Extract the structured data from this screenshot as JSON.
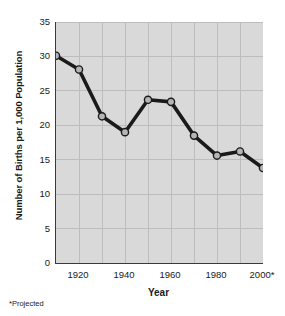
{
  "chart_data": {
    "type": "line",
    "title": "",
    "xlabel": "Year",
    "ylabel": "Number of Births per 1,000 Population",
    "x": [
      1910,
      1920,
      1930,
      1940,
      1950,
      1960,
      1970,
      1980,
      1990,
      2000
    ],
    "values": [
      30.1,
      28.1,
      21.3,
      19.0,
      23.7,
      23.4,
      18.5,
      15.6,
      16.2,
      13.8
    ],
    "series": [
      {
        "name": "Births per 1,000 population",
        "values": [
          30.1,
          28.1,
          21.3,
          19.0,
          23.7,
          23.4,
          18.5,
          15.6,
          16.2,
          13.8
        ]
      }
    ],
    "xlim": [
      1910,
      2000
    ],
    "ylim": [
      0,
      35
    ],
    "yticks": [
      0,
      5,
      10,
      15,
      20,
      25,
      30,
      35
    ],
    "ytick_labels": [
      "0",
      "5",
      "10",
      "15",
      "20",
      "25",
      "30",
      "35"
    ],
    "xticks": [
      1920,
      1940,
      1960,
      1980,
      2000
    ],
    "xtick_labels": [
      "1920",
      "1940",
      "1960",
      "1980",
      "2000*"
    ],
    "x_gridlines": [
      1920,
      1930,
      1940,
      1950,
      1960,
      1970,
      1980,
      1990,
      2000
    ],
    "grid": true,
    "legend": false,
    "footnote": "*Projected",
    "colors": {
      "plot_background": "#d9d9d9",
      "gridline": "#bdbdbd",
      "axis": "#3a3a3a",
      "line": "#1a1a1a",
      "marker_fill": "#b5b5b5",
      "marker_stroke": "#1a1a1a",
      "text": "#1a1a1a"
    }
  }
}
